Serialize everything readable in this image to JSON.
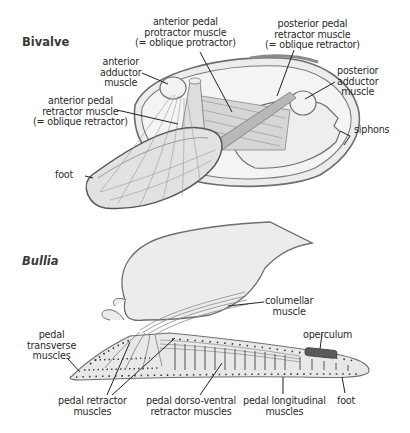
{
  "diagram": {
    "panels": [
      {
        "title": "Bivalve",
        "labels": {
          "anterior_pedal_protractor": "anterior pedal\nprotractor muscle\n(= oblique protractor)",
          "posterior_pedal_retractor": "posterior pedal\nretractor muscle\n(= oblique retractor)",
          "anterior_adductor": "anterior\nadductor\nmuscle",
          "anterior_pedal_retractor": "anterior pedal\nretractor muscle\n(= oblique retractor)",
          "posterior_adductor": "posterior\nadductor\nmuscle",
          "siphons": "siphons",
          "foot": "foot"
        }
      },
      {
        "title": "Bullia",
        "labels": {
          "columellar": "columellar\nmuscle",
          "operculum": "operculum",
          "pedal_transverse": "pedal\ntransverse\nmuscles",
          "pedal_retractor": "pedal retractor\nmuscles",
          "pedal_dorso_ventral": "pedal dorso-ventral\nretractor muscles",
          "pedal_longitudinal": "pedal longitudinal\nmuscles",
          "foot": "foot"
        }
      }
    ],
    "colors": {
      "shell_fill": "#ececec",
      "outline": "#6e6e6e",
      "muscle_fill": "#c8c8c8",
      "operculum": "#5a5a5a",
      "leader": "#222222"
    }
  }
}
